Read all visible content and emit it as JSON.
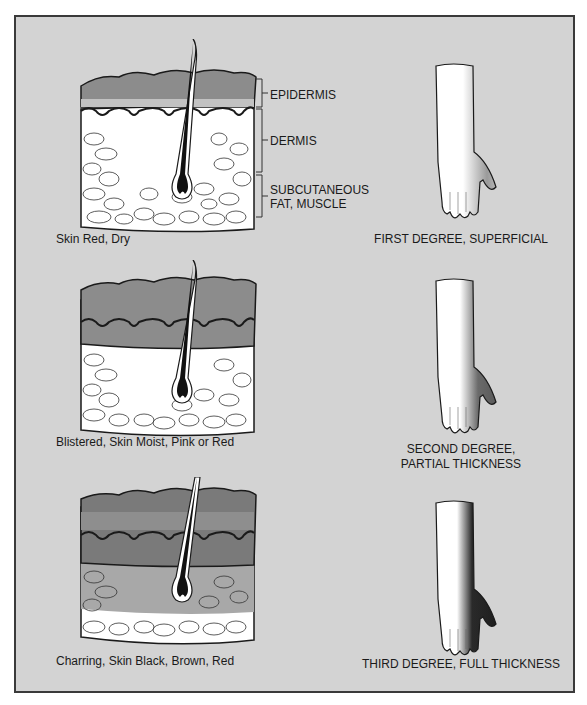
{
  "layer_labels": {
    "epidermis": "EPIDERMIS",
    "dermis": "DERMIS",
    "subcutaneous_line1": "SUBCUTANEOUS",
    "subcutaneous_line2": "FAT, MUSCLE"
  },
  "panels": [
    {
      "skin_caption": "Skin Red, Dry",
      "degree_line1": "FIRST DEGREE, SUPERFICIAL",
      "degree_line2": ""
    },
    {
      "skin_caption": "Blistered, Skin Moist, Pink or Red",
      "degree_line1": "SECOND DEGREE,",
      "degree_line2": "PARTIAL THICKNESS"
    },
    {
      "skin_caption": "Charring, Skin Black, Brown, Red",
      "degree_line1": "THIRD DEGREE, FULL THICKNESS",
      "degree_line2": ""
    }
  ],
  "colors": {
    "background": "#d3d3d3",
    "frame_border": "#3a3a3a",
    "epidermis_gray": "#8c8c8c",
    "burn_light": "#9a9a9a",
    "burn_dark": "#2a2a2a",
    "fat_white": "#ffffff"
  }
}
